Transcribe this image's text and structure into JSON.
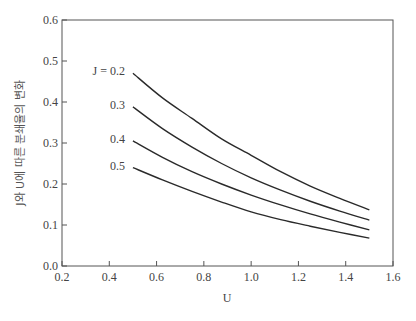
{
  "chart_data": {
    "type": "line",
    "title": "",
    "xlabel": "U",
    "ylabel": "J와 U에 따른 분쇄율의 변화",
    "xlim": [
      0.2,
      1.6
    ],
    "ylim": [
      0.0,
      0.6
    ],
    "xticks": [
      "0.2",
      "0.4",
      "0.6",
      "0.8",
      "1.0",
      "1.2",
      "1.4",
      "1.6"
    ],
    "yticks": [
      "0.0",
      "0.1",
      "0.2",
      "0.3",
      "0.4",
      "0.5",
      "0.6"
    ],
    "grid": false,
    "legend_position": "inline-left",
    "x": [
      0.5,
      0.625,
      0.75,
      0.875,
      1.0,
      1.125,
      1.25,
      1.375,
      1.5
    ],
    "series": [
      {
        "name": "J = 0.2",
        "label": "J = 0.2",
        "values": [
          0.47,
          0.41,
          0.36,
          0.31,
          0.27,
          0.23,
          0.195,
          0.165,
          0.137
        ]
      },
      {
        "name": "0.3",
        "label": "0.3",
        "values": [
          0.388,
          0.335,
          0.29,
          0.25,
          0.215,
          0.185,
          0.158,
          0.134,
          0.112
        ]
      },
      {
        "name": "0.4",
        "label": "0.4",
        "values": [
          0.305,
          0.265,
          0.23,
          0.2,
          0.173,
          0.149,
          0.127,
          0.107,
          0.088
        ]
      },
      {
        "name": "0.5",
        "label": "0.5",
        "values": [
          0.24,
          0.21,
          0.182,
          0.156,
          0.132,
          0.113,
          0.097,
          0.082,
          0.068
        ]
      }
    ]
  },
  "caption": "그림 ... 분쇄율 변화"
}
